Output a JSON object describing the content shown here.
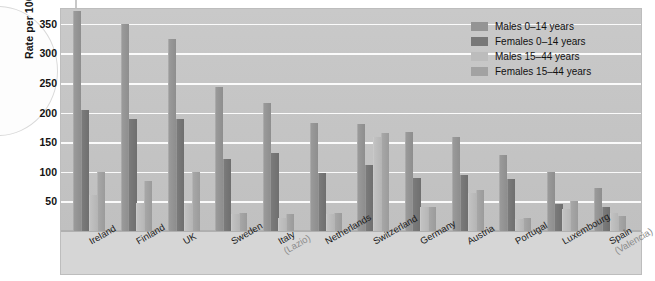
{
  "chart_data": {
    "type": "bar",
    "title": "",
    "xlabel": "",
    "ylabel": "Rate per 100,000 population",
    "ylim": [
      0,
      375
    ],
    "yticks": [
      50,
      100,
      150,
      200,
      250,
      300,
      350
    ],
    "grid": true,
    "legend_position": "top-right",
    "categories": [
      "Ireland",
      "Finland",
      "UK",
      "Sweden",
      "Italy (Lazio)",
      "Netherlands",
      "Switzerland",
      "Germany",
      "Austria",
      "Portugal",
      "Luxembourg",
      "Spain (Valencia)"
    ],
    "category_sublabels": [
      "",
      "",
      "",
      "",
      "(Lazio)",
      "",
      "",
      "",
      "",
      "",
      "",
      "(Valencia)"
    ],
    "series": [
      {
        "name": "Males 0–14 years",
        "color": "#949494",
        "values": [
          372,
          350,
          325,
          243,
          216,
          183,
          180,
          168,
          158,
          128,
          100,
          72
        ]
      },
      {
        "name": "Females 0–14 years",
        "color": "#777777",
        "values": [
          205,
          190,
          190,
          122,
          132,
          98,
          112,
          90,
          95,
          88,
          45,
          40
        ]
      },
      {
        "name": "Males 15–44 years",
        "color": "#bcbcbc",
        "values": [
          60,
          48,
          45,
          28,
          22,
          28,
          158,
          40,
          65,
          20,
          38,
          30
        ]
      },
      {
        "name": "Females 15–44 years",
        "color": "#a2a2a2",
        "values": [
          100,
          84,
          100,
          30,
          28,
          30,
          165,
          40,
          70,
          22,
          50,
          25
        ]
      }
    ]
  },
  "legend": {
    "items": [
      {
        "label": "Males 0–14 years",
        "color": "#949494"
      },
      {
        "label": "Females 0–14 years",
        "color": "#777777"
      },
      {
        "label": "Males 15–44 years",
        "color": "#bcbcbc"
      },
      {
        "label": "Females 15–44 years",
        "color": "#a2a2a2"
      }
    ]
  }
}
